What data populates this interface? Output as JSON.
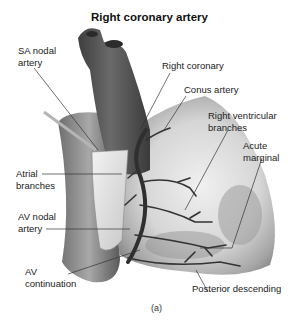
{
  "figure": {
    "title": "Right coronary artery",
    "caption": "(a)",
    "labels": {
      "sa_nodal": [
        "SA nodal",
        "artery"
      ],
      "right_coronary": "Right coronary",
      "conus": "Conus artery",
      "right_ventricular": [
        "Right ventricular",
        "branches"
      ],
      "acute_marginal": [
        "Acute",
        "marginal"
      ],
      "atrial": [
        "Atrial",
        "branches"
      ],
      "av_nodal": [
        "AV nodal",
        "artery"
      ],
      "av_continuation": [
        "AV",
        "continuation"
      ],
      "posterior_descending": "Posterior descending"
    }
  }
}
